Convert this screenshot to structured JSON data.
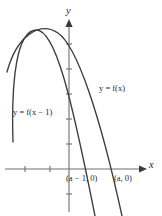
{
  "figure": {
    "axes": {
      "x_label": "x",
      "y_label": "y",
      "axis_color": "#6e6e6e",
      "curve_color": "#3d3d3d"
    },
    "labels": {
      "curve_fx": "y = f(x)",
      "curve_fx_shifted": "y = f(x − 1)",
      "point_a_minus_1": "(a − 1, 0)",
      "point_a": "(a, 0)"
    }
  },
  "chart_data": {
    "type": "line",
    "title": "",
    "xlabel": "x",
    "ylabel": "y",
    "grid": false,
    "legend": "inline-annotations",
    "background": "#ffffff",
    "series": [
      {
        "name": "y = f(x)",
        "color": "#3d3d3d",
        "kind": "parabola-downward",
        "vertex_px": [
          58,
          33
        ],
        "x_intercept_label": "(a, 0)",
        "x_intercept_px": [
          118,
          169
        ],
        "path_px": "M 7,72 Q 30,12 58,33 Q 92,60 122,216"
      },
      {
        "name": "y = f(x − 1)",
        "color": "#3d3d3d",
        "kind": "parabola-downward",
        "vertex_px": [
          35,
          30
        ],
        "x_intercept_label": "(a − 1, 0)",
        "x_intercept_px": [
          88,
          169
        ],
        "path_px": "M 13,142 Q 12,31 35,30 Q 64,30 95,216"
      }
    ],
    "annotations": [
      {
        "text": "y = f(x)",
        "x_px": 99,
        "y_px": 84
      },
      {
        "text": "y = f(x − 1)",
        "x_px": 13,
        "y_px": 108
      },
      {
        "text": "(a − 1, 0)",
        "x_px": 66,
        "y_px": 174
      },
      {
        "text": "(a, 0)",
        "x_px": 114,
        "y_px": 174
      }
    ],
    "axis_geometry_px": {
      "origin": [
        69,
        169
      ],
      "x_axis_from": [
        5,
        169
      ],
      "x_axis_to": [
        142,
        169
      ],
      "y_axis_from": [
        69,
        212
      ],
      "y_axis_to": [
        69,
        20
      ],
      "x_ticks_px": [
        25,
        50
      ],
      "y_ticks_px": [
        44,
        69,
        94,
        119,
        144,
        194
      ]
    },
    "note": "Translating the graph of y = f(x) one unit to the left gives y = f(x - 1) shifted; the x-intercept moves from (a, 0) to (a - 1, 0)."
  }
}
